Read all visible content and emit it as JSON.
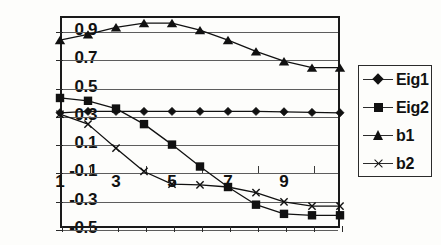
{
  "chart_data": {
    "type": "line",
    "title": "",
    "xlabel": "",
    "ylabel": "",
    "grid": true,
    "legend_position": "right",
    "x": [
      1,
      2,
      3,
      4,
      5,
      6,
      7,
      8,
      9,
      10,
      11
    ],
    "xticklabels": [
      "1",
      "",
      "3",
      "",
      "5",
      "",
      "7",
      "",
      "9",
      "",
      ""
    ],
    "yticklabels": [
      "0.9",
      "0.7",
      "0.5",
      "0.3",
      "0.1",
      "-0.1",
      "-0.3",
      "-0.5"
    ],
    "yticks": [
      0.9,
      0.7,
      0.5,
      0.3,
      0.1,
      -0.1,
      -0.3,
      -0.5
    ],
    "ylim": [
      -0.5,
      1.0
    ],
    "xlim": [
      1,
      11
    ],
    "series": [
      {
        "name": "Eig1",
        "marker": "diamond",
        "color": "#111111",
        "values": [
          0.315,
          0.325,
          0.325,
          0.325,
          0.325,
          0.325,
          0.325,
          0.325,
          0.322,
          0.318,
          0.315
        ]
      },
      {
        "name": "Eig2",
        "marker": "square",
        "color": "#111111",
        "values": [
          0.42,
          0.4,
          0.345,
          0.235,
          0.09,
          -0.065,
          -0.21,
          -0.335,
          -0.4,
          -0.41,
          -0.41
        ]
      },
      {
        "name": "b1",
        "marker": "triangle",
        "color": "#111111",
        "values": [
          0.83,
          0.87,
          0.92,
          0.95,
          0.95,
          0.9,
          0.83,
          0.75,
          0.68,
          0.635,
          0.635
        ]
      },
      {
        "name": "b2",
        "marker": "x",
        "color": "#111111",
        "values": [
          0.305,
          0.235,
          0.065,
          -0.1,
          -0.19,
          -0.195,
          -0.21,
          -0.25,
          -0.315,
          -0.345,
          -0.345
        ]
      }
    ]
  },
  "legend": {
    "entries": [
      {
        "label": "Eig1",
        "marker": "diamond-marker"
      },
      {
        "label": "Eig2",
        "marker": "square-marker"
      },
      {
        "label": "b1",
        "marker": "triangle-marker"
      },
      {
        "label": "b2",
        "marker": "cross-marker"
      }
    ]
  }
}
